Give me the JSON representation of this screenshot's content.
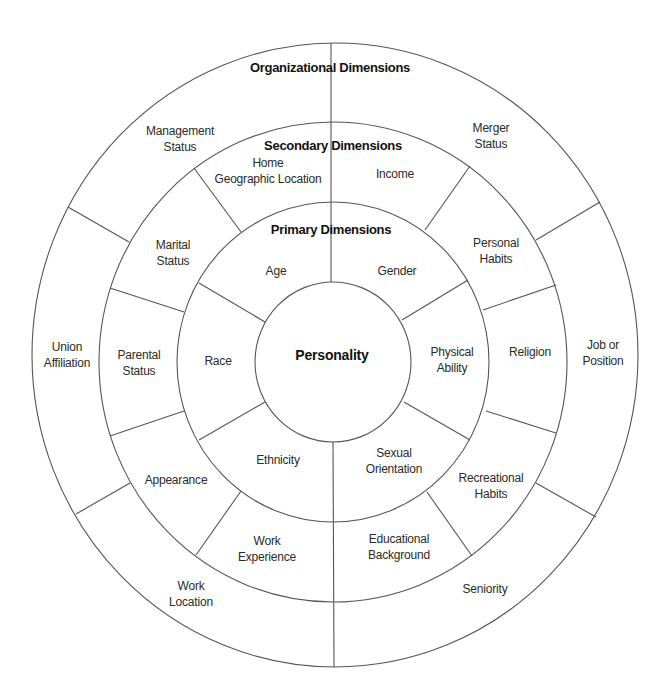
{
  "diagram": {
    "stroke_color": "#555555",
    "text_color": "#2a2a2a",
    "center_label": "Personality",
    "rings": {
      "primary": {
        "title": "Primary Dimensions",
        "segments": [
          {
            "lines": [
              "Age"
            ]
          },
          {
            "lines": [
              "Gender"
            ]
          },
          {
            "lines": [
              "Physical",
              "Ability"
            ]
          },
          {
            "lines": [
              "Sexual",
              "Orientation"
            ]
          },
          {
            "lines": [
              "Ethnicity"
            ]
          },
          {
            "lines": [
              "Race"
            ]
          }
        ]
      },
      "secondary": {
        "title": "Secondary Dimensions",
        "segments": [
          {
            "lines": [
              "Home",
              "Geographic Location"
            ]
          },
          {
            "lines": [
              "Income"
            ]
          },
          {
            "lines": [
              "Personal",
              "Habits"
            ]
          },
          {
            "lines": [
              "Religion"
            ]
          },
          {
            "lines": [
              "Recreational",
              "Habits"
            ]
          },
          {
            "lines": [
              "Educational",
              "Background"
            ]
          },
          {
            "lines": [
              "Work",
              "Experience"
            ]
          },
          {
            "lines": [
              "Appearance"
            ]
          },
          {
            "lines": [
              "Parental",
              "Status"
            ]
          },
          {
            "lines": [
              "Marital",
              "Status"
            ]
          }
        ]
      },
      "organizational": {
        "title": "Organizational Dimensions",
        "segments": [
          {
            "lines": [
              "Management",
              "Status"
            ]
          },
          {
            "lines": [
              "Merger",
              "Status"
            ]
          },
          {
            "lines": [
              "Job or",
              "Position"
            ]
          },
          {
            "lines": [
              "Seniority"
            ]
          },
          {
            "lines": [
              "Work",
              "Location"
            ]
          },
          {
            "lines": [
              "Union",
              "Affiliation"
            ]
          }
        ]
      }
    }
  }
}
